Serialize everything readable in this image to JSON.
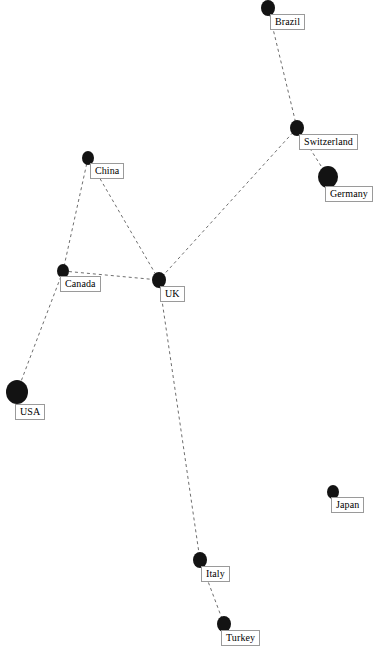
{
  "diagram": {
    "type": "network-graph",
    "title": "",
    "width": 382,
    "height": 651,
    "background_color": "#ffffff",
    "node_color": "#131313",
    "edge_color": "#6e6e6e",
    "label_text_color": "#000000",
    "label_background_color": "#ffffff",
    "label_border_color": "#9a9a9a",
    "edge_style": "dashed",
    "edge_dash_pattern": "3 3",
    "edge_width": 1
  },
  "nodes": [
    {
      "id": "brazil",
      "label": "Brazil",
      "x": 268,
      "y": 8,
      "r": 7,
      "label_x": 270,
      "label_y": 8
    },
    {
      "id": "switzerland",
      "label": "Switzerland",
      "x": 297,
      "y": 128,
      "r": 7,
      "label_x": 299,
      "label_y": 128
    },
    {
      "id": "germany",
      "label": "Germany",
      "x": 328,
      "y": 177,
      "r": 10,
      "label_x": 325,
      "label_y": 177
    },
    {
      "id": "china",
      "label": "China",
      "x": 88,
      "y": 158,
      "r": 6,
      "label_x": 90,
      "label_y": 158
    },
    {
      "id": "canada",
      "label": "Canada",
      "x": 63,
      "y": 271,
      "r": 6,
      "label_x": 60,
      "label_y": 271
    },
    {
      "id": "uk",
      "label": "UK",
      "x": 159,
      "y": 280,
      "r": 7,
      "label_x": 160,
      "label_y": 280
    },
    {
      "id": "usa",
      "label": "USA",
      "x": 17,
      "y": 392,
      "r": 11,
      "label_x": 15,
      "label_y": 394
    },
    {
      "id": "japan",
      "label": "Japan",
      "x": 333,
      "y": 492,
      "r": 6,
      "label_x": 331,
      "label_y": 492
    },
    {
      "id": "italy",
      "label": "Italy",
      "x": 200,
      "y": 560,
      "r": 7,
      "label_x": 201,
      "label_y": 560
    },
    {
      "id": "turkey",
      "label": "Turkey",
      "x": 224,
      "y": 624,
      "r": 7,
      "label_x": 221,
      "label_y": 624
    }
  ],
  "edges": [
    {
      "source": "brazil",
      "target": "switzerland"
    },
    {
      "source": "switzerland",
      "target": "germany"
    },
    {
      "source": "switzerland",
      "target": "uk"
    },
    {
      "source": "china",
      "target": "canada"
    },
    {
      "source": "china",
      "target": "uk"
    },
    {
      "source": "canada",
      "target": "uk"
    },
    {
      "source": "canada",
      "target": "usa"
    },
    {
      "source": "uk",
      "target": "italy"
    },
    {
      "source": "italy",
      "target": "turkey"
    }
  ]
}
